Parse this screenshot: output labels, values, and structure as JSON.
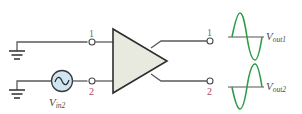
{
  "diagram": {
    "type": "differential amplifier single-ended input diagram",
    "colors": {
      "wire": "#5a5a5a",
      "amplifier_fill": "#e9eadf",
      "amplifier_stroke": "#333333",
      "source_fill": "#cfe6f2",
      "sine": "#2f9a48",
      "label_terminal_1": "#6b6b6b",
      "label_terminal_2": "#b04a5a"
    },
    "inputs": [
      {
        "terminal": "1",
        "connection": "ground"
      },
      {
        "terminal": "2",
        "connection": "ac-source"
      }
    ],
    "source": {
      "label_main": "V",
      "label_sub": "in2",
      "icon": "sine-source-icon"
    },
    "outputs": [
      {
        "terminal": "1",
        "label_main": "V",
        "label_sub": "out1",
        "waveform": "sine-in-phase"
      },
      {
        "terminal": "2",
        "label_main": "V",
        "label_sub": "out2",
        "waveform": "sine-inverted"
      }
    ]
  }
}
